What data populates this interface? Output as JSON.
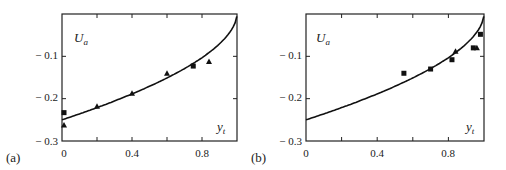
{
  "chart_data": [
    {
      "panel": "(a)",
      "type": "scatter",
      "ylabel": "U_a",
      "xlabel": "y_t",
      "xlim": [
        0,
        1
      ],
      "ylim": [
        -0.3,
        0
      ],
      "xticks": [
        "0",
        "0.4",
        "0.8"
      ],
      "yticks": [
        "-0.1",
        "-0.2",
        "-0.3"
      ],
      "grid": false,
      "series": [
        {
          "name": "theory",
          "kind": "line",
          "x": [
            0,
            0.2,
            0.4,
            0.6,
            0.75,
            0.85,
            0.92,
            0.97,
            1.0
          ],
          "y": [
            -0.25,
            -0.222,
            -0.19,
            -0.155,
            -0.125,
            -0.1,
            -0.075,
            -0.045,
            -0.01
          ]
        },
        {
          "name": "squares",
          "kind": "square",
          "x": [
            0.0,
            0.75
          ],
          "y": [
            -0.233,
            -0.123
          ]
        },
        {
          "name": "triangles",
          "kind": "triangle",
          "x": [
            0.0,
            0.2,
            0.4,
            0.6,
            0.84
          ],
          "y": [
            -0.262,
            -0.218,
            -0.187,
            -0.14,
            -0.112
          ]
        }
      ]
    },
    {
      "panel": "(b)",
      "type": "scatter",
      "ylabel": "U_a",
      "xlabel": "y_t",
      "xlim": [
        0,
        1
      ],
      "ylim": [
        -0.3,
        0
      ],
      "xticks": [
        "0",
        "0.4",
        "0.8"
      ],
      "yticks": [
        "-0.1",
        "-0.2",
        "-0.3"
      ],
      "grid": false,
      "series": [
        {
          "name": "theory",
          "kind": "line",
          "x": [
            0,
            0.2,
            0.4,
            0.6,
            0.75,
            0.85,
            0.92,
            0.97,
            1.0
          ],
          "y": [
            -0.25,
            -0.222,
            -0.19,
            -0.155,
            -0.125,
            -0.1,
            -0.075,
            -0.045,
            -0.01
          ]
        },
        {
          "name": "squares",
          "kind": "square",
          "x": [
            0.55,
            0.7,
            0.82,
            0.94,
            0.98
          ],
          "y": [
            -0.14,
            -0.13,
            -0.108,
            -0.08,
            -0.048
          ]
        },
        {
          "name": "triangles",
          "kind": "triangle",
          "x": [
            0.84,
            0.96
          ],
          "y": [
            -0.088,
            -0.08
          ]
        }
      ]
    }
  ],
  "labels": {
    "panel_a": "(a)",
    "panel_b": "(b)",
    "ua": "U",
    "ua_sub": "a",
    "yt": "y",
    "yt_sub": "t",
    "x0": "0",
    "x04": "0.4",
    "x08": "0.8",
    "y01": "− 0.1",
    "y02": "− 0.2",
    "y03": "− 0.3"
  }
}
